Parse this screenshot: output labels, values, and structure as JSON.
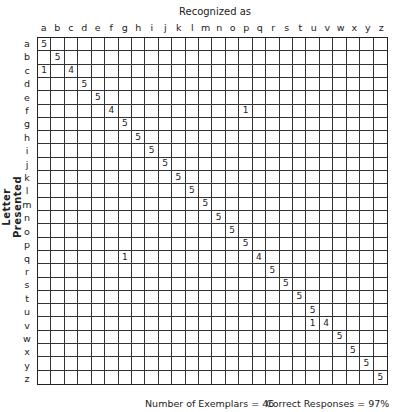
{
  "chart_data": {
    "type": "heatmap",
    "title": "Recognized as",
    "xlabel": "Recognized as",
    "ylabel": "Letter Presented",
    "x_categories": [
      "a",
      "b",
      "c",
      "d",
      "e",
      "f",
      "g",
      "h",
      "i",
      "j",
      "k",
      "l",
      "m",
      "n",
      "o",
      "p",
      "q",
      "r",
      "s",
      "t",
      "u",
      "v",
      "w",
      "x",
      "y",
      "z"
    ],
    "y_categories": [
      "a",
      "b",
      "c",
      "d",
      "e",
      "f",
      "g",
      "h",
      "i",
      "j",
      "k",
      "l",
      "m",
      "n",
      "o",
      "p",
      "q",
      "r",
      "s",
      "t",
      "u",
      "v",
      "w",
      "x",
      "y",
      "z"
    ],
    "cells": [
      {
        "row": "a",
        "col": "a",
        "value": 5
      },
      {
        "row": "b",
        "col": "b",
        "value": 5
      },
      {
        "row": "c",
        "col": "a",
        "value": 1
      },
      {
        "row": "c",
        "col": "c",
        "value": 4
      },
      {
        "row": "d",
        "col": "d",
        "value": 5
      },
      {
        "row": "e",
        "col": "e",
        "value": 5
      },
      {
        "row": "f",
        "col": "f",
        "value": 4
      },
      {
        "row": "f",
        "col": "p",
        "value": 1
      },
      {
        "row": "g",
        "col": "g",
        "value": 5
      },
      {
        "row": "h",
        "col": "h",
        "value": 5
      },
      {
        "row": "i",
        "col": "i",
        "value": 5
      },
      {
        "row": "j",
        "col": "j",
        "value": 5
      },
      {
        "row": "k",
        "col": "k",
        "value": 5
      },
      {
        "row": "l",
        "col": "l",
        "value": 5
      },
      {
        "row": "m",
        "col": "m",
        "value": 5
      },
      {
        "row": "n",
        "col": "n",
        "value": 5
      },
      {
        "row": "o",
        "col": "o",
        "value": 5
      },
      {
        "row": "p",
        "col": "p",
        "value": 5
      },
      {
        "row": "q",
        "col": "g",
        "value": 1
      },
      {
        "row": "q",
        "col": "q",
        "value": 4
      },
      {
        "row": "r",
        "col": "r",
        "value": 5
      },
      {
        "row": "s",
        "col": "s",
        "value": 5
      },
      {
        "row": "t",
        "col": "t",
        "value": 5
      },
      {
        "row": "u",
        "col": "u",
        "value": 5
      },
      {
        "row": "v",
        "col": "u",
        "value": 1
      },
      {
        "row": "v",
        "col": "v",
        "value": 4
      },
      {
        "row": "w",
        "col": "w",
        "value": 5
      },
      {
        "row": "x",
        "col": "x",
        "value": 5
      },
      {
        "row": "y",
        "col": "y",
        "value": 5
      },
      {
        "row": "z",
        "col": "z",
        "value": 5
      }
    ],
    "annotations": [
      "Number of Exemplars = 46",
      "Correct Responses = 97%"
    ],
    "grid": true
  },
  "footer": {
    "exemplars": "Number of Exemplars = 46",
    "correct": "Correct Responses = 97%"
  }
}
